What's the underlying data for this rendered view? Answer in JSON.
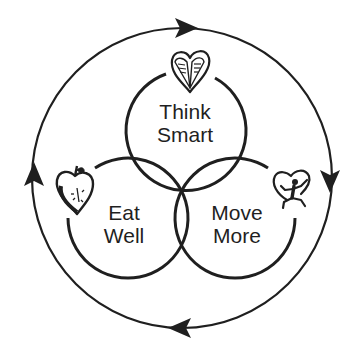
{
  "diagram": {
    "type": "venn-cycle",
    "colors": {
      "stroke": "#1f1f1f",
      "background": "#ffffff"
    },
    "cycle_direction": "clockwise",
    "circles": [
      {
        "id": "think-smart",
        "lines": [
          "Think",
          "Smart"
        ],
        "icon": "heart-book-icon"
      },
      {
        "id": "eat-well",
        "lines": [
          "Eat",
          "Well"
        ],
        "icon": "heart-apple-icon"
      },
      {
        "id": "move-more",
        "lines": [
          "Move",
          "More"
        ],
        "icon": "heart-runner-icon"
      }
    ],
    "arrows": [
      "top-right",
      "right-down",
      "bottom-left",
      "left-up"
    ]
  }
}
